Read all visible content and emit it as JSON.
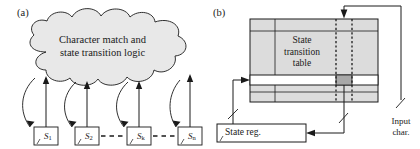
{
  "figure": {
    "panels": [
      {
        "id": "a",
        "label": "(a)",
        "cloud": {
          "line1": "Character match and",
          "line2": "state transition logic",
          "fill": "#e8e8e8",
          "stroke": "#1a1a1a"
        },
        "states": [
          {
            "name": "S",
            "subscript": "1"
          },
          {
            "name": "S",
            "subscript": "2"
          },
          {
            "name": "S",
            "subscript": "k"
          },
          {
            "name": "S",
            "subscript": "n"
          }
        ],
        "ellipsis_marks": [
          "- - -",
          "- - -"
        ]
      },
      {
        "id": "b",
        "label": "(b)",
        "table": {
          "line1": "State",
          "line2": "transition",
          "line3": "table",
          "fill": "#dcdcdc",
          "highlight_fill": "#ffffff",
          "cell_fill": "#a8a8a8",
          "stroke": "#1a1a1a"
        },
        "state_register": {
          "label": "State reg."
        },
        "input": {
          "line1": "Input",
          "line2": "char."
        }
      }
    ]
  },
  "colors": {
    "ink": "#1a1a1a",
    "cloud_fill": "#e8e8e8",
    "table_fill": "#dcdcdc",
    "table_cell_fill": "#a8a8a8",
    "highlight": "#ffffff"
  }
}
